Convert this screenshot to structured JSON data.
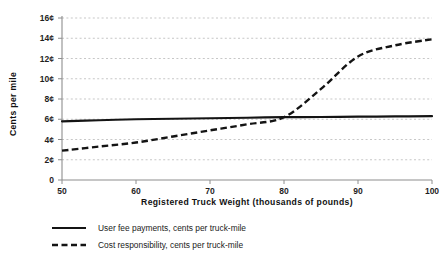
{
  "chart_data": {
    "type": "line",
    "title": "",
    "xlabel": "Registered Truck Weight (thousands of pounds)",
    "ylabel": "Cents per mile",
    "xlim": [
      50,
      100
    ],
    "ylim": [
      0,
      16
    ],
    "xticks": [
      50,
      60,
      70,
      80,
      90,
      100
    ],
    "xtick_labels": [
      "50",
      "60",
      "70",
      "80",
      "90",
      "100"
    ],
    "yticks": [
      0,
      2,
      4,
      6,
      8,
      10,
      12,
      14,
      16
    ],
    "ytick_labels": [
      "0",
      "2¢",
      "4¢",
      "6¢",
      "8¢",
      "10¢",
      "12¢",
      "14¢",
      "16¢"
    ],
    "grid": true,
    "legend_position": "below",
    "series": [
      {
        "name": "User fee payments, cents per truck-mile",
        "style": "solid",
        "color": "#141414",
        "x": [
          50,
          55,
          60,
          65,
          70,
          75,
          80,
          85,
          90,
          95,
          100
        ],
        "values": [
          5.8,
          5.9,
          6.0,
          6.05,
          6.1,
          6.15,
          6.2,
          6.22,
          6.25,
          6.28,
          6.3
        ]
      },
      {
        "name": "Cost responsibility, cents per truck-mile",
        "style": "dashed",
        "color": "#141414",
        "x": [
          50,
          55,
          60,
          65,
          70,
          75,
          80,
          85,
          90,
          95,
          100
        ],
        "values": [
          2.9,
          3.3,
          3.7,
          4.3,
          4.9,
          5.5,
          6.2,
          9.0,
          12.2,
          13.3,
          13.9
        ]
      }
    ]
  },
  "legend": {
    "items": [
      {
        "label": "User fee payments, cents per truck-mile",
        "style": "solid"
      },
      {
        "label": "Cost responsibility, cents per truck-mile",
        "style": "dashed"
      }
    ]
  }
}
